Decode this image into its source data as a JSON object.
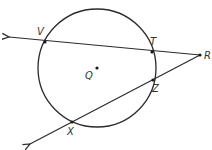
{
  "diagram": {
    "type": "geometry-circle-secants",
    "circle": {
      "center_label": "Q",
      "cx": 97,
      "cy": 68,
      "r": 59
    },
    "points": [
      {
        "id": "V",
        "label": "V",
        "x": 45,
        "y": 42,
        "label_x": 37,
        "label_y": 35
      },
      {
        "id": "T",
        "label": "T",
        "x": 152,
        "y": 52,
        "label_x": 150,
        "label_y": 45
      },
      {
        "id": "R",
        "label": "R",
        "x": 200,
        "y": 55,
        "label_x": 204,
        "label_y": 59
      },
      {
        "id": "Z",
        "label": "Z",
        "x": 153,
        "y": 80,
        "label_x": 152,
        "label_y": 92
      },
      {
        "id": "X",
        "label": "X",
        "x": 72,
        "y": 122,
        "label_x": 67,
        "label_y": 135
      },
      {
        "id": "Q",
        "label": "Q",
        "x": 97,
        "y": 68,
        "label_x": 84,
        "label_y": 78
      }
    ],
    "lines": [
      {
        "id": "ray-RV",
        "from": "R",
        "through": "V",
        "arrow_end": {
          "x": 9,
          "y": 37
        }
      },
      {
        "id": "ray-RX",
        "from": "R",
        "through": "X",
        "arrow_end": {
          "x": 30,
          "y": 144
        }
      }
    ],
    "stroke_color": "#2b2b2b"
  }
}
